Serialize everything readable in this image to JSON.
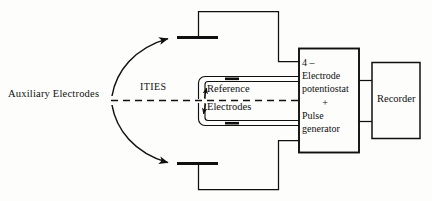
{
  "figure": {
    "background_color": "#fdfdfb",
    "ink_color": "#101010"
  },
  "labels": {
    "auxiliary_electrodes": "Auxiliary Electrodes",
    "ities": "ITIES",
    "reference": "Reference",
    "electrodes": "Electrodes",
    "recorder": "Recorder"
  },
  "potentiostat": {
    "line1": "4 –",
    "line2": "Electrode",
    "line3": "potentiostat",
    "line4": "+",
    "line5": "Pulse",
    "line6": "generator"
  },
  "components": [
    {
      "name": "auxiliary-electrode-top",
      "kind": "electrode-bar"
    },
    {
      "name": "auxiliary-electrode-bottom",
      "kind": "electrode-bar"
    },
    {
      "name": "reference-electrode-upper",
      "kind": "electrode-tube"
    },
    {
      "name": "reference-electrode-lower",
      "kind": "electrode-tube"
    },
    {
      "name": "potentiostat-box",
      "kind": "instrument-box"
    },
    {
      "name": "recorder-box",
      "kind": "instrument-box"
    },
    {
      "name": "ities-interface",
      "kind": "dashed-interface-line"
    }
  ]
}
